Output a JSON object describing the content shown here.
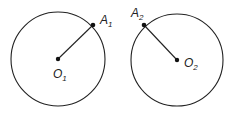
{
  "diagram": {
    "circles": [
      {
        "id": "circle-1",
        "center": {
          "x": 58,
          "y": 59
        },
        "radius": 47,
        "center_label": {
          "main": "O",
          "sub": "1"
        },
        "point": {
          "x": 93,
          "y": 26
        },
        "point_label": {
          "main": "A",
          "sub": "1"
        }
      },
      {
        "id": "circle-2",
        "center": {
          "x": 176,
          "y": 60
        },
        "radius": 46,
        "center_label": {
          "main": "O",
          "sub": "2"
        },
        "point": {
          "x": 144,
          "y": 25
        },
        "point_label": {
          "main": "A",
          "sub": "2"
        }
      }
    ],
    "stroke_color": "#222222"
  }
}
